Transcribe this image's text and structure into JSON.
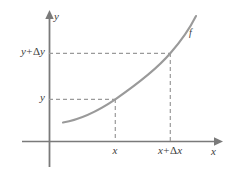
{
  "figure": {
    "kind": "math-diagram",
    "background_color": "#ffffff",
    "width": 230,
    "height": 179
  },
  "axes": {
    "y_axis": {
      "name": "y-axis",
      "label": "y",
      "color": "#7a7a7a",
      "x": 49,
      "top": 12,
      "bottom": 167,
      "arrow": "up"
    },
    "x_axis": {
      "name": "x-axis",
      "label": "x",
      "color": "#7a7a7a",
      "y": 141,
      "left": 22,
      "right": 222,
      "arrow": "right"
    }
  },
  "curve": {
    "name": "function-curve",
    "label": "f",
    "color": "#9a9a9a",
    "stroke_width": 2,
    "shape": "increasing convex (exponential-like)",
    "start_point": [
      63,
      122
    ],
    "end_point": [
      196,
      16
    ]
  },
  "tick_labels": {
    "y_lower": "y",
    "y_upper_prefix": "y",
    "y_upper_operator": "+",
    "y_upper_delta": "Δ",
    "y_upper_variable": "y",
    "x_lower": "x",
    "x_upper_prefix": "x",
    "x_upper_operator": "+",
    "x_upper_delta": "Δ",
    "x_upper_variable": "x"
  },
  "guide_lines": {
    "color": "#9a9a9a",
    "dash": "4 3",
    "items": [
      {
        "name": "horizontal-guide-y",
        "orientation": "horizontal",
        "from": [
          49,
          99
        ],
        "to": [
          116,
          99
        ]
      },
      {
        "name": "horizontal-guide-y-plus-dy",
        "orientation": "horizontal",
        "from": [
          49,
          53
        ],
        "to": [
          171,
          53
        ]
      },
      {
        "name": "vertical-guide-x",
        "orientation": "vertical",
        "from": [
          115,
          100
        ],
        "to": [
          115,
          141
        ]
      },
      {
        "name": "vertical-guide-x-plus-dx",
        "orientation": "vertical",
        "from": [
          170,
          54
        ],
        "to": [
          170,
          141
        ]
      }
    ]
  },
  "points": {
    "lower": {
      "name": "point-x-y",
      "coords": [
        115,
        99
      ]
    },
    "upper": {
      "name": "point-x-plus-dx-y-plus-dy",
      "coords": [
        170,
        53
      ]
    }
  }
}
